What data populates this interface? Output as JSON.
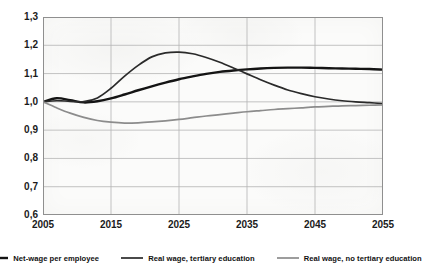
{
  "chart_data": {
    "type": "line",
    "title": "",
    "xlabel": "",
    "ylabel": "",
    "xlim": [
      2005,
      2055
    ],
    "ylim": [
      0.6,
      1.3
    ],
    "grid": true,
    "legend_position": "bottom",
    "x_ticks": [
      "2005",
      "2015",
      "2025",
      "2035",
      "2045",
      "2055"
    ],
    "y_ticks": [
      "1,3",
      "1,2",
      "1,1",
      "1,0",
      "0,9",
      "0,8",
      "0,7",
      "0,6"
    ],
    "x_tick_values": [
      2005,
      2015,
      2025,
      2035,
      2045,
      2055
    ],
    "y_tick_values": [
      1.3,
      1.2,
      1.1,
      1.0,
      0.9,
      0.8,
      0.7,
      0.6
    ],
    "x": [
      2005,
      2007,
      2009,
      2011,
      2013,
      2015,
      2017,
      2019,
      2021,
      2023,
      2025,
      2027,
      2029,
      2031,
      2033,
      2035,
      2037,
      2039,
      2041,
      2043,
      2045,
      2047,
      2049,
      2051,
      2053,
      2055
    ],
    "series": [
      {
        "name": "Net-wage per employee",
        "color": "#141414",
        "width": 2.4,
        "values": [
          1.0,
          1.013,
          1.006,
          0.998,
          1.002,
          1.012,
          1.026,
          1.041,
          1.055,
          1.068,
          1.08,
          1.09,
          1.099,
          1.106,
          1.111,
          1.115,
          1.118,
          1.12,
          1.121,
          1.121,
          1.12,
          1.119,
          1.118,
          1.117,
          1.116,
          1.114
        ]
      },
      {
        "name": "Real wage, tertiary education",
        "color": "#2a2a2a",
        "width": 1.7,
        "values": [
          1.0,
          1.004,
          1.002,
          1.001,
          1.014,
          1.048,
          1.091,
          1.129,
          1.159,
          1.173,
          1.176,
          1.17,
          1.157,
          1.14,
          1.12,
          1.099,
          1.078,
          1.059,
          1.042,
          1.029,
          1.018,
          1.01,
          1.004,
          1.0,
          0.997,
          0.994
        ]
      },
      {
        "name": "Real wage, no tertiary education",
        "color": "#8c8c8c",
        "width": 1.7,
        "values": [
          1.0,
          0.979,
          0.96,
          0.945,
          0.934,
          0.928,
          0.925,
          0.926,
          0.929,
          0.933,
          0.938,
          0.944,
          0.95,
          0.955,
          0.96,
          0.965,
          0.969,
          0.973,
          0.976,
          0.979,
          0.982,
          0.984,
          0.986,
          0.987,
          0.988,
          0.989
        ]
      }
    ]
  },
  "legend": [
    {
      "label": "Net-wage per employee"
    },
    {
      "label": "Real wage, tertiary education"
    },
    {
      "label": "Real wage, no tertiary education"
    }
  ]
}
